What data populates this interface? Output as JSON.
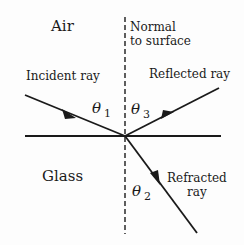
{
  "diagram": {
    "type": "ray-optics-reflection-refraction",
    "media": {
      "top": "Air",
      "bottom": "Glass"
    },
    "normal": {
      "label_line1": "Normal",
      "label_line2": "to surface",
      "style": "dashed"
    },
    "rays": {
      "incident": {
        "label": "Incident ray"
      },
      "reflected": {
        "label": "Reflected ray"
      },
      "refracted": {
        "label_line1": "Refracted",
        "label_line2": "ray"
      }
    },
    "angles": {
      "theta1": {
        "symbol": "θ",
        "subscript": "1"
      },
      "theta2": {
        "symbol": "θ",
        "subscript": "2"
      },
      "theta3": {
        "symbol": "θ",
        "subscript": "3"
      }
    },
    "colors": {
      "line": "#1a1a1a",
      "text": "#1a1a1a",
      "background": "#fdfdfd"
    }
  }
}
